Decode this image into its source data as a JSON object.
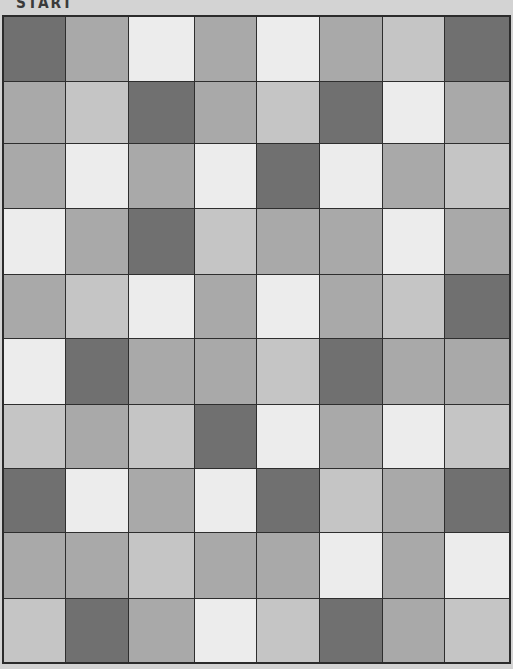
{
  "header": {
    "start_label": "START"
  },
  "palette": {
    "D": "#707070",
    "M": "#a9a9a9",
    "L": "#c5c5c5",
    "W": "#ececec",
    "background": "#d3d3d3",
    "grid_line": "#2e2e2e"
  },
  "board": {
    "rows": 10,
    "cols": 8,
    "col_widths": [
      62,
      63,
      67,
      62,
      63,
      64,
      62,
      64
    ],
    "row_heights": [
      65,
      62,
      66,
      66,
      64,
      66,
      64,
      65,
      66,
      63
    ],
    "cells": [
      [
        "D",
        "M",
        "W",
        "M",
        "W",
        "M",
        "L",
        "D"
      ],
      [
        "M",
        "L",
        "D",
        "M",
        "L",
        "D",
        "W",
        "M"
      ],
      [
        "M",
        "W",
        "M",
        "W",
        "D",
        "W",
        "M",
        "L"
      ],
      [
        "W",
        "M",
        "D",
        "L",
        "M",
        "M",
        "W",
        "M"
      ],
      [
        "M",
        "L",
        "W",
        "M",
        "W",
        "M",
        "L",
        "D"
      ],
      [
        "W",
        "D",
        "M",
        "M",
        "L",
        "D",
        "M",
        "M"
      ],
      [
        "L",
        "M",
        "L",
        "D",
        "W",
        "M",
        "W",
        "L"
      ],
      [
        "D",
        "W",
        "M",
        "W",
        "D",
        "L",
        "M",
        "D"
      ],
      [
        "M",
        "M",
        "L",
        "M",
        "M",
        "W",
        "M",
        "W"
      ],
      [
        "L",
        "D",
        "M",
        "W",
        "L",
        "D",
        "M",
        "L"
      ]
    ]
  }
}
